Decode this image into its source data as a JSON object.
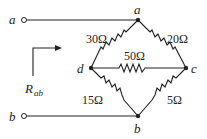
{
  "diagram": {
    "type": "resistor-bridge-circuit",
    "terminals": [
      {
        "id": "terminal-a",
        "label": "a"
      },
      {
        "id": "terminal-b",
        "label": "b"
      }
    ],
    "nodes": [
      {
        "id": "a",
        "label": "a"
      },
      {
        "id": "b",
        "label": "b"
      },
      {
        "id": "c",
        "label": "c"
      },
      {
        "id": "d",
        "label": "d"
      }
    ],
    "resistors": [
      {
        "from": "a",
        "to": "d",
        "label": "30Ω"
      },
      {
        "from": "a",
        "to": "c",
        "label": "20Ω"
      },
      {
        "from": "d",
        "to": "c",
        "label": "50Ω"
      },
      {
        "from": "d",
        "to": "b",
        "label": "15Ω"
      },
      {
        "from": "c",
        "to": "b",
        "label": "5Ω"
      }
    ],
    "equivalent": {
      "label": "R",
      "subscript": "ab"
    }
  }
}
